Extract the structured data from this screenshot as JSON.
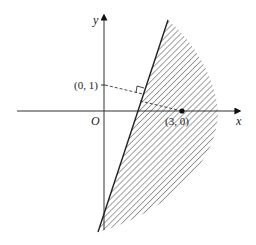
{
  "diagram": {
    "axes": {
      "x_label": "x",
      "y_label": "y",
      "origin_label": "O"
    },
    "points": [
      {
        "label": "(0, 1)",
        "x": 0,
        "y": 1
      },
      {
        "label": "(3, 0)",
        "x": 3,
        "y": 0
      }
    ],
    "annotations": {
      "right_angle_marker": true,
      "shaded_region": "hatched region to the right of the slanted line, bounded by a curved arc"
    },
    "colors": {
      "stroke": "#222222",
      "hatch": "#555555",
      "background": "#ffffff"
    }
  }
}
